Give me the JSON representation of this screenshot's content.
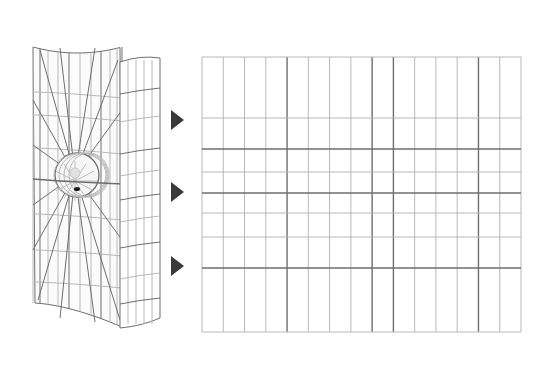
{
  "figure": {
    "colors": {
      "background": "#ffffff",
      "grid_light": "#b8b8b8",
      "grid_dark": "#6e6e6e",
      "arrow": "#3a3a3a",
      "dot": "#1a1a1a"
    },
    "cylinder": {
      "label": "",
      "sphere_center": [
        75,
        175
      ],
      "sphere_radius": 22
    },
    "arrows": [
      {
        "name": "arrow-top",
        "y": 120
      },
      {
        "name": "arrow-middle",
        "y": 192
      },
      {
        "name": "arrow-bottom",
        "y": 266
      }
    ],
    "flat_grid": {
      "left": 202,
      "top": 57,
      "right": 521,
      "bottom": 332,
      "columns": 15,
      "horizontal_lines": [
        118,
        149,
        172,
        193,
        213,
        237,
        268
      ],
      "dark_horizontal_lines": [
        149,
        193,
        268
      ],
      "dark_vertical_indices": [
        4,
        8,
        9,
        13
      ]
    }
  }
}
